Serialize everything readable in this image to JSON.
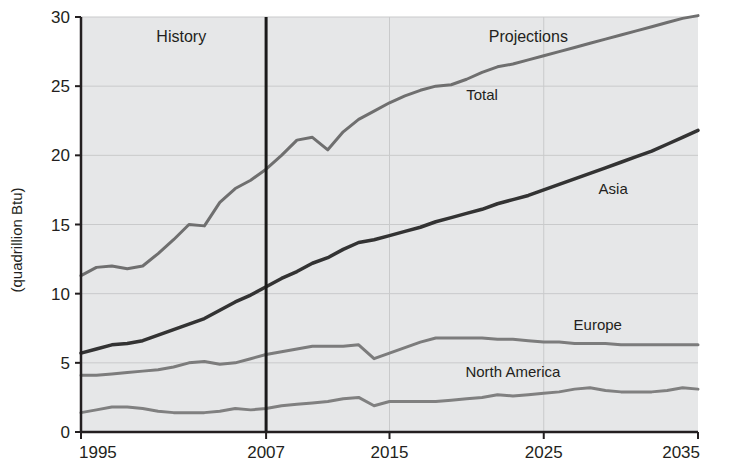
{
  "chart_data": {
    "type": "line",
    "title": "",
    "subtitle": "",
    "xlabel": "",
    "ylabel": "(quadrillion Btu)",
    "xlim": [
      1995,
      2035
    ],
    "ylim": [
      0,
      30
    ],
    "xticks": [
      1995,
      2007,
      2015,
      2025,
      2035
    ],
    "xtick_labels": [
      "1995",
      "2007",
      "2015",
      "2025",
      "2035"
    ],
    "yticks": [
      0,
      5,
      10,
      15,
      20,
      25,
      30
    ],
    "ytick_labels": [
      "0",
      "5",
      "10",
      "15",
      "20",
      "25",
      "30"
    ],
    "grid": true,
    "legend_position": "inline-labels",
    "history_projection_split": 2007,
    "annotations": [
      {
        "text": "History",
        "x": 2001.5,
        "y": 28.2
      },
      {
        "text": "Projections",
        "x": 2024.0,
        "y": 28.2
      }
    ],
    "x": [
      1995,
      1996,
      1997,
      1998,
      1999,
      2000,
      2001,
      2002,
      2003,
      2004,
      2005,
      2006,
      2007,
      2008,
      2009,
      2010,
      2011,
      2012,
      2013,
      2014,
      2015,
      2016,
      2017,
      2018,
      2019,
      2020,
      2021,
      2022,
      2023,
      2024,
      2025,
      2026,
      2027,
      2028,
      2029,
      2030,
      2031,
      2032,
      2033,
      2034,
      2035
    ],
    "series": [
      {
        "name": "Total",
        "label": "Total",
        "color": "#6f6f6f",
        "width": 3,
        "label_x": 2021.0,
        "label_y": 24.0,
        "values": [
          11.3,
          11.9,
          12.0,
          11.8,
          12.0,
          12.9,
          13.9,
          15.0,
          14.9,
          16.6,
          17.6,
          18.2,
          19.0,
          20.0,
          21.1,
          21.3,
          20.4,
          21.7,
          22.6,
          23.2,
          23.8,
          24.3,
          24.7,
          25.0,
          25.1,
          25.5,
          26.0,
          26.4,
          26.6,
          26.9,
          27.2,
          27.5,
          27.8,
          28.1,
          28.4,
          28.7,
          29.0,
          29.3,
          29.6,
          29.9,
          30.1
        ]
      },
      {
        "name": "Asia",
        "label": "Asia",
        "color": "#333333",
        "width": 3.5,
        "label_x": 2029.5,
        "label_y": 17.2,
        "values": [
          5.7,
          6.0,
          6.3,
          6.4,
          6.6,
          7.0,
          7.4,
          7.8,
          8.2,
          8.8,
          9.4,
          9.9,
          10.5,
          11.1,
          11.6,
          12.2,
          12.6,
          13.2,
          13.7,
          13.9,
          14.2,
          14.5,
          14.8,
          15.2,
          15.5,
          15.8,
          16.1,
          16.5,
          16.8,
          17.1,
          17.5,
          17.9,
          18.3,
          18.7,
          19.1,
          19.5,
          19.9,
          20.3,
          20.8,
          21.3,
          21.8
        ]
      },
      {
        "name": "Europe",
        "label": "Europe",
        "color": "#7c7c7c",
        "width": 3,
        "label_x": 2028.5,
        "label_y": 7.4,
        "values": [
          4.1,
          4.1,
          4.2,
          4.3,
          4.4,
          4.5,
          4.7,
          5.0,
          5.1,
          4.9,
          5.0,
          5.3,
          5.6,
          5.8,
          6.0,
          6.2,
          6.2,
          6.2,
          6.3,
          5.3,
          5.7,
          6.1,
          6.5,
          6.8,
          6.8,
          6.8,
          6.8,
          6.7,
          6.7,
          6.6,
          6.5,
          6.5,
          6.4,
          6.4,
          6.4,
          6.3,
          6.3,
          6.3,
          6.3,
          6.3,
          6.3
        ]
      },
      {
        "name": "North America",
        "label": "North America",
        "color": "#808080",
        "width": 3,
        "label_x": 2023.0,
        "label_y": 4.0,
        "values": [
          1.4,
          1.6,
          1.8,
          1.8,
          1.7,
          1.5,
          1.4,
          1.4,
          1.4,
          1.5,
          1.7,
          1.6,
          1.7,
          1.9,
          2.0,
          2.1,
          2.2,
          2.4,
          2.5,
          1.9,
          2.2,
          2.2,
          2.2,
          2.2,
          2.3,
          2.4,
          2.5,
          2.7,
          2.6,
          2.7,
          2.8,
          2.9,
          3.1,
          3.2,
          3.0,
          2.9,
          2.9,
          2.9,
          3.0,
          3.2,
          3.1
        ]
      }
    ]
  }
}
